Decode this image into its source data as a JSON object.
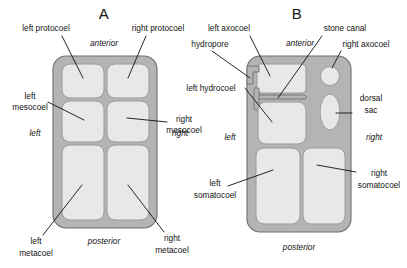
{
  "figure": {
    "background_color": "#ffffff",
    "body_wall_color": "#b4b4b4",
    "chamber_color": "#e8e8e8",
    "outline_color": "#6e6e6e",
    "text_color": "#141414"
  },
  "panels": [
    {
      "letter": "A",
      "orientation_labels": {
        "anterior": "anterior",
        "posterior": "posterior",
        "left": "left",
        "right": "right"
      },
      "callouts": [
        {
          "id": "left-protocoel",
          "text": "left protocoel"
        },
        {
          "id": "right-protocoel",
          "text": "right protocoel"
        },
        {
          "id": "left-mesocoel",
          "line1": "left",
          "line2": "mesocoel"
        },
        {
          "id": "right-mesocoel",
          "line1": "right",
          "line2": "mesocoel"
        },
        {
          "id": "left-metacoel",
          "line1": "left",
          "line2": "metacoel"
        },
        {
          "id": "right-metacoel",
          "line1": "right",
          "line2": "metacoel"
        }
      ]
    },
    {
      "letter": "B",
      "orientation_labels": {
        "anterior": "anterior",
        "posterior": "posterior",
        "left": "left",
        "right": "right"
      },
      "callouts": [
        {
          "id": "left-axocoel",
          "text": "left axocoel"
        },
        {
          "id": "hydropore",
          "text": "hydropore"
        },
        {
          "id": "stone-canal",
          "text": "stone canal"
        },
        {
          "id": "right-axocoel",
          "text": "right axocoel"
        },
        {
          "id": "left-hydrocoel",
          "text": "left hydrocoel"
        },
        {
          "id": "dorsal-sac",
          "line1": "dorsal",
          "line2": "sac"
        },
        {
          "id": "left-somatocoel",
          "line1": "left",
          "line2": "somatocoel"
        },
        {
          "id": "right-somatocoel",
          "line1": "right",
          "line2": "somatocoel"
        }
      ]
    }
  ]
}
